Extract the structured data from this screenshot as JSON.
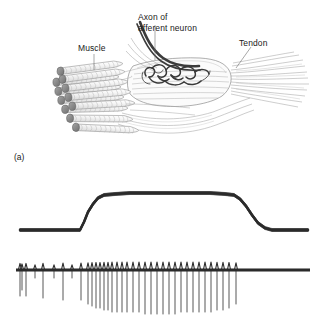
{
  "figure": {
    "background_color": "#ffffff",
    "width": 320,
    "height": 331
  },
  "panel_a": {
    "tag": "(a)",
    "description": "Line drawing of a muscle spindle embedded among extrafusal muscle fibers, with afferent axon and tendon",
    "labels": [
      {
        "id": "muscle",
        "text": "Muscle"
      },
      {
        "id": "axon",
        "text": "Axon of\nafferent neuron",
        "line1": "Axon of",
        "line2": "afferent neuron"
      },
      {
        "id": "tendon",
        "text": "Tendon"
      }
    ],
    "colors": {
      "outline": "#8d8d8d",
      "fiber_cap": "#8a8a8a",
      "fiber_body": "#f2f2f2",
      "nerve_dark": "#3a3a3a",
      "striation": "#b9b9b9",
      "tendon_fiber": "#a8a8a8",
      "label_text": "#1a1a1a"
    },
    "fiber_bundle": {
      "count": 11,
      "striations_per_fiber": 12
    }
  },
  "panel_b": {
    "tag": "(b)",
    "description": "Upper trace: muscle stretch/tension step. Lower trace: afferent action potential train whose frequency rises during the stretch.",
    "trace_color": "#2b2b2b",
    "traces": [
      {
        "id": "stretch",
        "name": "stretch-tension-trace"
      },
      {
        "id": "spikes",
        "name": "afferent-spike-train-trace"
      }
    ]
  },
  "chart_data": {
    "type": "line",
    "xlabel": "",
    "ylabel": "",
    "grid": false,
    "legend": null,
    "series": [
      {
        "name": "Muscle stretch (length/tension)",
        "panel": "upper",
        "type": "line",
        "xlim": [
          0,
          320
        ],
        "ylim": [
          0,
          56
        ],
        "points": [
          [
            20,
            12
          ],
          [
            40,
            12
          ],
          [
            60,
            12
          ],
          [
            75,
            12
          ],
          [
            80,
            12
          ],
          [
            84,
            20
          ],
          [
            88,
            30
          ],
          [
            93,
            38
          ],
          [
            98,
            44
          ],
          [
            104,
            47
          ],
          [
            115,
            48
          ],
          [
            130,
            49
          ],
          [
            150,
            49
          ],
          [
            170,
            49
          ],
          [
            190,
            49
          ],
          [
            210,
            49
          ],
          [
            225,
            48
          ],
          [
            234,
            47
          ],
          [
            240,
            43
          ],
          [
            246,
            36
          ],
          [
            252,
            27
          ],
          [
            258,
            19
          ],
          [
            265,
            14
          ],
          [
            272,
            12
          ],
          [
            285,
            12
          ],
          [
            300,
            12
          ],
          [
            308,
            12
          ]
        ]
      },
      {
        "name": "Afferent action potentials",
        "panel": "lower",
        "type": "spike-train",
        "baseline_y": 36,
        "xlim": [
          0,
          320
        ],
        "spike_times": [
          20,
          22,
          26,
          35,
          43,
          54,
          63,
          72,
          81,
          88,
          92,
          96,
          100,
          104,
          108,
          112,
          117,
          122,
          127,
          133,
          139,
          145,
          151,
          157,
          163,
          169,
          175,
          181,
          187,
          193,
          199,
          205,
          211,
          217,
          223,
          229,
          236
        ],
        "spike_amplitudes": [
          26,
          20,
          26,
          8,
          28,
          8,
          30,
          8,
          30,
          34,
          36,
          38,
          38,
          40,
          40,
          42,
          42,
          42,
          42,
          42,
          42,
          44,
          44,
          44,
          44,
          44,
          44,
          42,
          42,
          42,
          42,
          42,
          42,
          40,
          40,
          38,
          34
        ],
        "notes": "Low baseline firing rate before stretch; rate increases sharply at stretch onset (dynamic response) and stays elevated during the plateau (static response); firing returns to baseline after release."
      }
    ]
  }
}
